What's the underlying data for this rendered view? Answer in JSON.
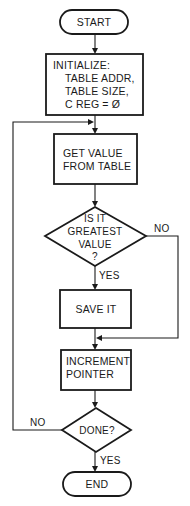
{
  "diagram": {
    "type": "flowchart",
    "nodes": {
      "start": {
        "kind": "terminal",
        "label": "START"
      },
      "initialize": {
        "kind": "process",
        "lines": [
          "INITIALIZE:",
          "TABLE ADDR,",
          "TABLE SIZE,",
          "C REG = Ø"
        ]
      },
      "get_value": {
        "kind": "process",
        "lines": [
          "GET VALUE",
          "FROM TABLE"
        ]
      },
      "is_greatest": {
        "kind": "decision",
        "lines": [
          "IS IT",
          "GREATEST",
          "VALUE",
          "?"
        ]
      },
      "save_it": {
        "kind": "process",
        "label": "SAVE IT"
      },
      "increment": {
        "kind": "process",
        "lines": [
          "INCREMENT",
          "POINTER"
        ]
      },
      "done": {
        "kind": "decision",
        "label": "DONE?"
      },
      "end": {
        "kind": "terminal",
        "label": "END"
      }
    },
    "edges": {
      "greatest_no": "NO",
      "greatest_yes": "YES",
      "done_no": "NO",
      "done_yes": "YES"
    },
    "connections": [
      [
        "start",
        "initialize"
      ],
      [
        "initialize",
        "get_value"
      ],
      [
        "get_value",
        "is_greatest"
      ],
      [
        "is_greatest",
        "save_it",
        "YES"
      ],
      [
        "is_greatest",
        "increment",
        "NO"
      ],
      [
        "save_it",
        "increment"
      ],
      [
        "increment",
        "done"
      ],
      [
        "done",
        "end",
        "YES"
      ],
      [
        "done",
        "get_value",
        "NO"
      ]
    ]
  }
}
